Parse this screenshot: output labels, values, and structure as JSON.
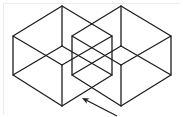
{
  "diagram": {
    "colors": {
      "line": "#1e1e1e",
      "background": "#ffffff",
      "frame": "#ececec"
    },
    "cubes": [
      {
        "name": "left-cube",
        "outline": [
          [
            62,
            6
          ],
          [
            112,
            36
          ],
          [
            112,
            75
          ],
          [
            62,
            106
          ],
          [
            13,
            75
          ],
          [
            13,
            36
          ]
        ],
        "inner_top_vertex": [
          62,
          46
        ],
        "inner_bottom_vertex": [
          62,
          65
        ]
      },
      {
        "name": "right-cube",
        "outline": [
          [
            121,
            6
          ],
          [
            171,
            36
          ],
          [
            171,
            75
          ],
          [
            121,
            106
          ],
          [
            72,
            75
          ],
          [
            72,
            36
          ]
        ],
        "inner_top_vertex": [
          121,
          46
        ],
        "inner_bottom_vertex": [
          121,
          65
        ]
      }
    ],
    "arrow": {
      "tip": [
        82,
        98
      ],
      "tail": [
        117,
        116
      ],
      "icon": "arrow-up-left-icon"
    }
  }
}
